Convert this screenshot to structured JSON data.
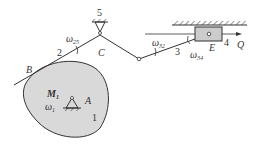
{
  "diagram": {
    "type": "mechanism",
    "labels": {
      "B": "B",
      "C": "C",
      "A": "A",
      "E": "E",
      "Q": "Q",
      "M1": "M",
      "M1_sub": "1",
      "w1": "ω",
      "w1_sub": "1",
      "w25": "ω",
      "w25_sub": "25",
      "w32": "ω",
      "w32_sub": "32",
      "w34": "ω",
      "w34_sub": "34",
      "link1": "1",
      "link2": "2",
      "link3": "3",
      "link4": "4",
      "link5": "5"
    },
    "colors": {
      "cam_fill": "#d9d9d9",
      "slider_fill": "#cccccc",
      "line": "#333333"
    }
  }
}
